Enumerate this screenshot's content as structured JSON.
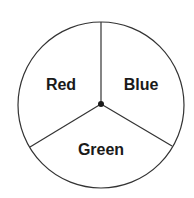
{
  "diagram": {
    "type": "spinner",
    "sections": [
      {
        "label": "Red"
      },
      {
        "label": "Blue"
      },
      {
        "label": "Green"
      }
    ],
    "colors": {
      "stroke": "#333333",
      "text": "#1a1a1a",
      "background": "#ffffff"
    }
  }
}
